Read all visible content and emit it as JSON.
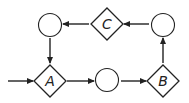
{
  "diagram": {
    "type": "state-flow",
    "colors": {
      "stroke": "#222222",
      "background": "#ffffff"
    },
    "nodes": [
      {
        "id": "A",
        "shape": "diamond",
        "label": "A"
      },
      {
        "id": "B",
        "shape": "diamond",
        "label": "B"
      },
      {
        "id": "C",
        "shape": "diamond",
        "label": "C"
      },
      {
        "id": "circle-bottom",
        "shape": "circle",
        "label": ""
      },
      {
        "id": "circle-top-right",
        "shape": "circle",
        "label": ""
      },
      {
        "id": "circle-top-left",
        "shape": "circle",
        "label": ""
      }
    ],
    "edges": [
      {
        "from": "entry",
        "to": "A"
      },
      {
        "from": "A",
        "to": "circle-bottom"
      },
      {
        "from": "circle-bottom",
        "to": "B"
      },
      {
        "from": "B",
        "to": "circle-top-right"
      },
      {
        "from": "circle-top-right",
        "to": "C"
      },
      {
        "from": "C",
        "to": "circle-top-left"
      },
      {
        "from": "circle-top-left",
        "to": "A"
      }
    ]
  }
}
